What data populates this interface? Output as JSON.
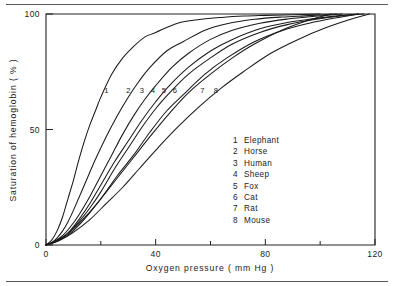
{
  "chart_data": {
    "type": "line",
    "title": "",
    "xlabel": "Oxygen pressure ( mm Hg )",
    "ylabel": "Saturation of hemoglobin ( % )",
    "xlim": [
      0,
      120
    ],
    "ylim": [
      0,
      100
    ],
    "grid": false,
    "legend_position": "inside-lower-right",
    "x_ticks_major": [
      0,
      40,
      80,
      120
    ],
    "x_ticks_minor": [
      20,
      60,
      100
    ],
    "x_tick_labels": [
      "0",
      "40",
      "80",
      "120"
    ],
    "y_ticks_major": [
      0,
      50,
      100
    ],
    "y_tick_labels": [
      "0",
      "50",
      "100"
    ],
    "series": [
      {
        "name": "Elephant",
        "number": "1",
        "p50": 18,
        "hill_n": 2.8,
        "label_x": 22,
        "label_y": 66,
        "x": [
          0,
          2,
          4,
          6,
          8,
          10,
          12,
          14,
          16,
          18,
          20,
          24,
          28,
          32,
          36,
          40,
          48,
          56,
          64,
          72,
          80,
          90,
          100
        ],
        "y": [
          0,
          2,
          6,
          12,
          20,
          28,
          37,
          45,
          52,
          58,
          64,
          74,
          81,
          86,
          90,
          92,
          96,
          97.6,
          98.5,
          99.1,
          99.4,
          99.7,
          100
        ]
      },
      {
        "name": "Horse",
        "number": "2",
        "p50": 24,
        "hill_n": 2.8,
        "label_x": 30,
        "label_y": 66,
        "x": [
          0,
          2,
          4,
          6,
          8,
          10,
          14,
          18,
          22,
          26,
          30,
          34,
          38,
          44,
          50,
          58,
          66,
          76,
          86,
          96,
          106
        ],
        "y": [
          0,
          1,
          3,
          6,
          10,
          15,
          26,
          37,
          47,
          56,
          64,
          71,
          77,
          84,
          88,
          93,
          95.8,
          97.7,
          98.7,
          99.3,
          100
        ]
      },
      {
        "name": "Human",
        "number": "3",
        "p50": 30,
        "hill_n": 2.8,
        "label_x": 35,
        "label_y": 66,
        "x": [
          0,
          3,
          6,
          9,
          12,
          16,
          20,
          24,
          28,
          32,
          36,
          40,
          46,
          52,
          60,
          68,
          78,
          88,
          98,
          108
        ],
        "y": [
          0,
          1.5,
          4,
          8,
          13,
          21,
          30,
          39,
          48,
          56,
          63,
          69,
          77,
          83,
          89,
          93,
          96,
          97.8,
          99,
          100
        ]
      },
      {
        "name": "Sheep",
        "number": "4",
        "p50": 33,
        "hill_n": 2.8,
        "label_x": 39,
        "label_y": 66,
        "x": [
          0,
          3,
          6,
          9,
          12,
          16,
          20,
          25,
          30,
          35,
          40,
          45,
          52,
          60,
          68,
          78,
          88,
          98,
          108,
          114
        ],
        "y": [
          0,
          1.2,
          3.2,
          6.5,
          11,
          18,
          26,
          36,
          45,
          54,
          62,
          69,
          77,
          84,
          89,
          93.6,
          96.3,
          98,
          99.4,
          100
        ]
      },
      {
        "name": "Fox",
        "number": "5",
        "p50": 36,
        "hill_n": 2.8,
        "label_x": 43,
        "label_y": 66,
        "x": [
          0,
          4,
          8,
          12,
          16,
          20,
          25,
          30,
          35,
          40,
          46,
          52,
          60,
          68,
          78,
          88,
          98,
          108,
          116
        ],
        "y": [
          0,
          1.8,
          5,
          10,
          16,
          23,
          33,
          42,
          51,
          59,
          67,
          74,
          81,
          87,
          92,
          95.4,
          97.6,
          99.2,
          100
        ]
      },
      {
        "name": "Cat",
        "number": "6",
        "p50": 38,
        "hill_n": 2.8,
        "label_x": 47,
        "label_y": 66,
        "x": [
          0,
          4,
          8,
          12,
          16,
          20,
          26,
          32,
          38,
          44,
          50,
          58,
          66,
          76,
          86,
          96,
          106,
          114
        ],
        "y": [
          0,
          1.5,
          4.3,
          8.6,
          14,
          20,
          30,
          39,
          49,
          58,
          65,
          74,
          81,
          88,
          92.8,
          96,
          98.4,
          100
        ]
      },
      {
        "name": "Rat",
        "number": "7",
        "p50": 49,
        "hill_n": 2.6,
        "label_x": 57,
        "label_y": 66,
        "x": [
          0,
          5,
          10,
          15,
          20,
          26,
          32,
          38,
          45,
          52,
          60,
          68,
          76,
          86,
          96,
          104
        ],
        "y": [
          0,
          2.5,
          7,
          13,
          20,
          29,
          38,
          47,
          57,
          66,
          74,
          81,
          87,
          93,
          97.4,
          100
        ]
      },
      {
        "name": "Mouse",
        "number": "8",
        "p50": 54,
        "hill_n": 2.6,
        "label_x": 62,
        "label_y": 66,
        "x": [
          0,
          5,
          10,
          16,
          22,
          28,
          34,
          40,
          48,
          56,
          64,
          72,
          82,
          92,
          102,
          112,
          118
        ],
        "y": [
          0,
          2,
          5.5,
          11,
          18,
          25,
          33,
          41,
          51,
          60,
          68,
          75,
          83,
          89,
          94,
          98,
          100
        ]
      }
    ]
  },
  "legend": {
    "entries": [
      {
        "number": "1",
        "label": "Elephant"
      },
      {
        "number": "2",
        "label": "Horse"
      },
      {
        "number": "3",
        "label": "Human"
      },
      {
        "number": "4",
        "label": "Sheep"
      },
      {
        "number": "5",
        "label": "Fox"
      },
      {
        "number": "6",
        "label": "Cat"
      },
      {
        "number": "7",
        "label": "Rat"
      },
      {
        "number": "8",
        "label": "Mouse"
      }
    ]
  },
  "colors": {
    "ink": "#1a1a1a",
    "frame": "#222222",
    "rule": "#5a5a5a",
    "background": "#ffffff"
  }
}
